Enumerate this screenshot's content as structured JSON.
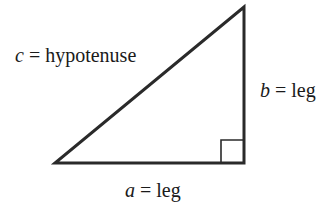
{
  "diagram": {
    "type": "right-triangle",
    "stroke_color": "#2a2a2a",
    "vertices": {
      "top": [
        244,
        7
      ],
      "bottom_left": [
        55,
        163
      ],
      "right_angle": [
        244,
        163
      ]
    },
    "right_angle_marker_size": 23,
    "labels": {
      "hypotenuse": {
        "var": "c",
        "eq": " = ",
        "text": "hypotenuse"
      },
      "vertical_leg": {
        "var": "b",
        "eq": " = ",
        "text": "leg"
      },
      "horizontal_leg": {
        "var": "a",
        "eq": " = ",
        "text": "leg"
      }
    }
  }
}
